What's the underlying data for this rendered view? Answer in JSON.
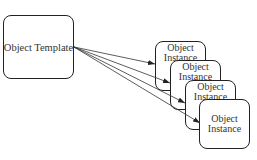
{
  "diagram": {
    "template": {
      "label": "Object Template"
    },
    "instances": [
      {
        "label_line1": "Object",
        "label_line2": "Instance"
      },
      {
        "label_line1": "Object",
        "label_line2": "Instance"
      },
      {
        "label_line1": "Object",
        "label_line2": "Instance"
      },
      {
        "label_line1": "Object",
        "label_line2": "Instance"
      }
    ],
    "edges": [
      {
        "from": "template",
        "to": "instance-1"
      },
      {
        "from": "template",
        "to": "instance-2"
      },
      {
        "from": "template",
        "to": "instance-3"
      },
      {
        "from": "template",
        "to": "instance-4"
      }
    ]
  }
}
